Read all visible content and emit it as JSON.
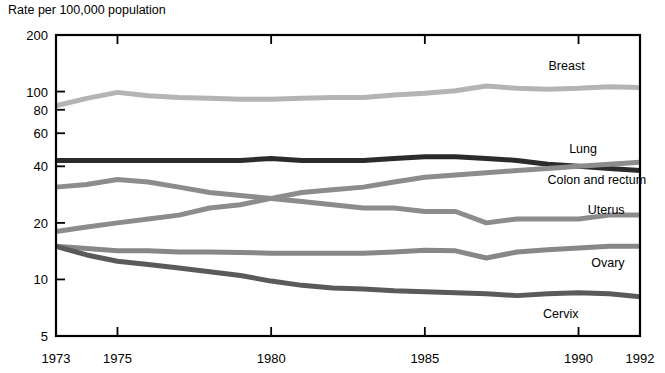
{
  "chart_data": {
    "type": "line",
    "title": "",
    "ylabel": "Rate per 100,000 population",
    "xlabel": "",
    "yscale": "log",
    "ylim": [
      5,
      200
    ],
    "xlim": [
      1973,
      1992
    ],
    "grid": false,
    "legend_position": "right-inline-labels",
    "y_ticks": [
      5,
      10,
      20,
      40,
      60,
      80,
      100,
      200
    ],
    "y_tick_labels": [
      "5",
      "10",
      "20",
      "40",
      "60",
      "80",
      "100",
      "200"
    ],
    "x_ticks": [
      1973,
      1975,
      1980,
      1985,
      1990,
      1992
    ],
    "x_tick_labels": [
      "1973",
      "1975",
      "1980",
      "1985",
      "1990",
      "1992"
    ],
    "x": [
      1973,
      1974,
      1975,
      1976,
      1977,
      1978,
      1979,
      1980,
      1981,
      1982,
      1983,
      1984,
      1985,
      1986,
      1987,
      1988,
      1989,
      1990,
      1991,
      1992
    ],
    "series": [
      {
        "name": "Breast",
        "color": "#b4b4b4",
        "label": "Breast",
        "values": [
          84,
          92,
          99,
          95,
          93,
          92,
          91,
          91,
          92,
          93,
          93,
          96,
          98,
          101,
          107,
          104,
          103,
          104,
          106,
          105
        ]
      },
      {
        "name": "Colon and rectum",
        "color": "#2b2b2b",
        "label": "Colon and rectum",
        "values": [
          43,
          43,
          43,
          43,
          43,
          43,
          43,
          44,
          43,
          43,
          43,
          44,
          45,
          45,
          44,
          43,
          41,
          40,
          39,
          38
        ]
      },
      {
        "name": "Lung",
        "color": "#8c8c8c",
        "label": "Lung",
        "values": [
          18,
          19,
          20,
          21,
          22,
          24,
          25,
          27,
          29,
          30,
          31,
          33,
          35,
          36,
          37,
          38,
          39,
          40,
          41,
          42
        ]
      },
      {
        "name": "Uterus",
        "color": "#8c8c8c",
        "label": "Uterus",
        "values": [
          31,
          32,
          34,
          33,
          31,
          29,
          28,
          27,
          26,
          25,
          24,
          24,
          23,
          23,
          20,
          21,
          21,
          21,
          22,
          22
        ]
      },
      {
        "name": "Ovary",
        "color": "#878787",
        "label": "Ovary",
        "values": [
          15,
          14.6,
          14.2,
          14.2,
          14,
          14,
          13.9,
          13.8,
          13.8,
          13.8,
          13.8,
          14,
          14.3,
          14.2,
          13,
          14,
          14.4,
          14.7,
          15,
          15
        ]
      },
      {
        "name": "Cervix",
        "color": "#5a5a5a",
        "label": "Cervix",
        "values": [
          15,
          13.5,
          12.5,
          12,
          11.5,
          11,
          10.5,
          9.8,
          9.3,
          9,
          8.9,
          8.7,
          8.6,
          8.5,
          8.4,
          8.2,
          8.4,
          8.5,
          8.4,
          8.1
        ]
      }
    ],
    "series_label_anchors": [
      {
        "name": "Breast",
        "x": 1990.2,
        "y_px": 70
      },
      {
        "name": "Lung",
        "x": 1990.6,
        "y_px": 153
      },
      {
        "name": "Colon and rectum",
        "x": 1992.2,
        "y_px": 184
      },
      {
        "name": "Uterus",
        "x": 1991.5,
        "y_px": 214
      },
      {
        "name": "Ovary",
        "x": 1991.5,
        "y_px": 267
      },
      {
        "name": "Cervix",
        "x": 1990.0,
        "y_px": 318
      }
    ]
  }
}
